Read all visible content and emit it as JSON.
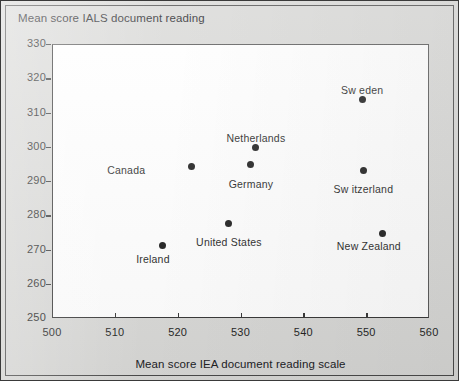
{
  "chart_data": {
    "type": "scatter",
    "title": "Mean score IALS document reading",
    "xlabel": "Mean score IEA document reading scale",
    "ylabel": "Mean score IALS document reading",
    "xlim": [
      500,
      560
    ],
    "ylim": [
      250,
      330
    ],
    "xticks": [
      500,
      510,
      520,
      530,
      540,
      550,
      560
    ],
    "yticks": [
      250,
      260,
      270,
      280,
      290,
      300,
      310,
      320,
      330
    ],
    "grid": false,
    "legend": null,
    "points": [
      {
        "label": "Ireland",
        "x": 517.5,
        "y": 271.5,
        "label_dx": -10,
        "label_dy": 14,
        "label_align": "center"
      },
      {
        "label": "Canada",
        "x": 522.0,
        "y": 294.5,
        "label_dx": -52,
        "label_dy": 3,
        "label_align": "left"
      },
      {
        "label": "United States",
        "x": 528.0,
        "y": 278.0,
        "label_dx": 0,
        "label_dy": 19,
        "label_align": "center"
      },
      {
        "label": "Germany",
        "x": 531.5,
        "y": 295.0,
        "label_dx": 0,
        "label_dy": 19,
        "label_align": "center"
      },
      {
        "label": "Netherlands",
        "x": 532.3,
        "y": 300.0,
        "label_dx": 0,
        "label_dy": -10,
        "label_align": "center"
      },
      {
        "label": "Sw eden",
        "x": 549.2,
        "y": 314.0,
        "label_dx": 0,
        "label_dy": -10,
        "label_align": "center"
      },
      {
        "label": "Sw itzerland",
        "x": 549.4,
        "y": 293.5,
        "label_dx": 0,
        "label_dy": 19,
        "label_align": "center"
      },
      {
        "label": "New  Zealand",
        "x": 552.5,
        "y": 275.0,
        "label_dx": -14,
        "label_dy": 13,
        "label_align": "center"
      }
    ]
  }
}
